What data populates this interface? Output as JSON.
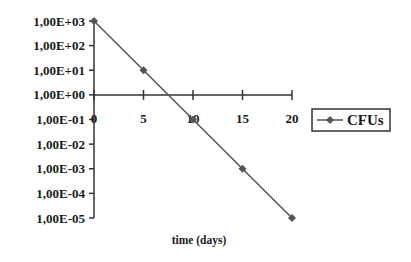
{
  "chart_data": {
    "type": "line",
    "title": "",
    "xlabel": "time (days)",
    "ylabel": "",
    "yscale": "log",
    "x": [
      0,
      5,
      10,
      15,
      20
    ],
    "series": [
      {
        "name": "CFUs",
        "values": [
          1000,
          10,
          0.1,
          0.001,
          1e-05
        ],
        "color": "#555555",
        "marker": "diamond"
      }
    ],
    "xlim": [
      0,
      20
    ],
    "ylim": [
      1e-05,
      1000
    ],
    "x_ticks": [
      "0",
      "5",
      "10",
      "15",
      "20"
    ],
    "y_ticks": [
      "1,00E+03",
      "1,00E+02",
      "1,00E+01",
      "1,00E+00",
      "1,00E-01",
      "1,00E-02",
      "1,00E-03",
      "1,00E-04",
      "1,00E-05"
    ],
    "x_axis_crosses_at": 1,
    "grid": false,
    "legend_position": "right"
  },
  "legend": {
    "label": "CFUs"
  },
  "axis": {
    "xlabel": "time (days)"
  }
}
